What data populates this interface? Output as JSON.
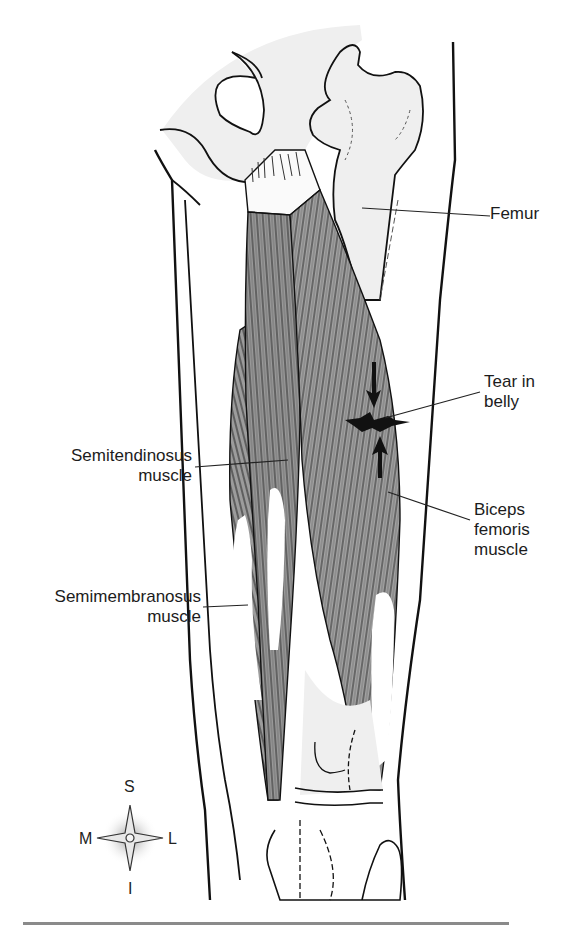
{
  "figure": {
    "colors": {
      "background": "#ffffff",
      "bone_fill": "#efefef",
      "muscle_fill": "#9a9a9a",
      "muscle_light": "#b8b8b8",
      "outline": "#111111",
      "leader_line": "#222222",
      "bottom_rule": "#8a8a8a"
    }
  },
  "labels": {
    "femur": "Femur",
    "tear_line1": "Tear in",
    "tear_line2": "belly",
    "semitendinosus_line1": "Semitendinosus",
    "semitendinosus_line2": "muscle",
    "biceps_line1": "Biceps",
    "biceps_line2": "femoris",
    "biceps_line3": "muscle",
    "semimembranosus_line1": "Semimembranosus",
    "semimembranosus_line2": "muscle"
  },
  "compass": {
    "superior": "S",
    "inferior": "I",
    "medial": "M",
    "lateral": "L"
  }
}
